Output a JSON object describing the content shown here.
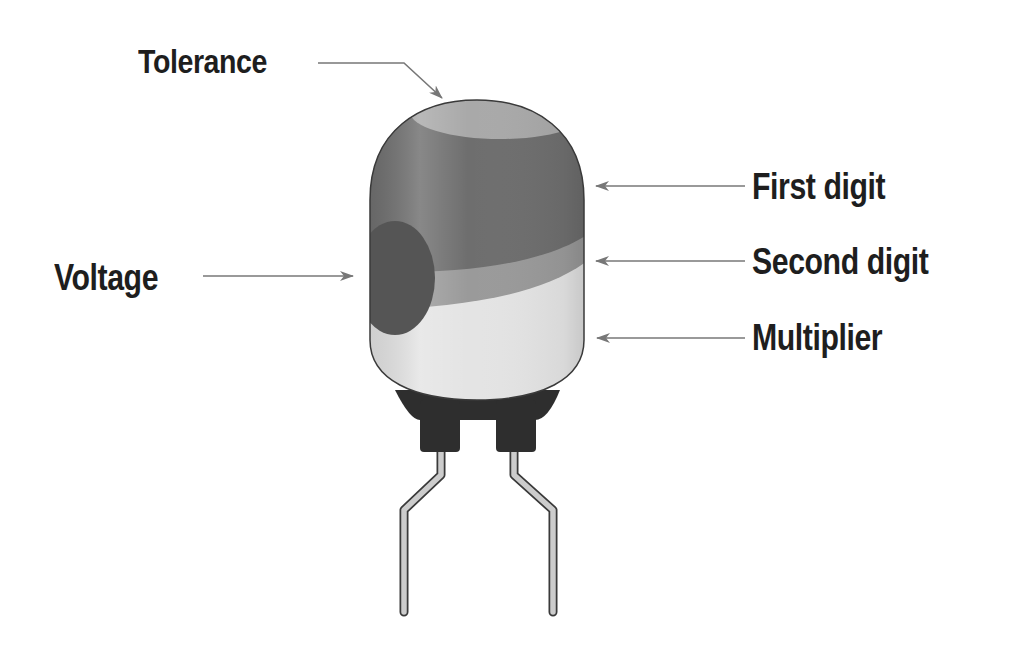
{
  "diagram": {
    "labels": {
      "tolerance": "Tolerance",
      "first_digit": "First digit",
      "second_digit": "Second digit",
      "multiplier": "Multiplier",
      "voltage": "Voltage"
    },
    "colors": {
      "text": "#1e1e1e",
      "arrow": "#777777",
      "outline": "#3a3a3a",
      "tolerance_band": "#a9a9a9",
      "first_digit_band": "#6e6e6e",
      "second_digit_band": "#9a9a9a",
      "multiplier_band": "#e4e4e4",
      "voltage_dot": "#555555",
      "base": "#2e2e2e",
      "leads": "#c8c8c8"
    }
  }
}
